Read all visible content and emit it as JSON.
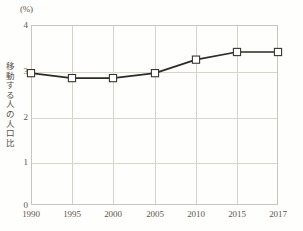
{
  "chart_data": {
    "type": "line",
    "title": "",
    "subtitle": "",
    "unit_label": "(%)",
    "ylabel": "移動する人の人口比",
    "xlabel": "",
    "categories": [
      "1990",
      "1995",
      "2000",
      "2005",
      "2010",
      "2015",
      "2017"
    ],
    "x": [
      1990,
      1995,
      2000,
      2005,
      2010,
      2015,
      2017
    ],
    "values": [
      2.93,
      2.82,
      2.82,
      2.93,
      3.23,
      3.4,
      3.4
    ],
    "series": [
      {
        "name": "移動する人の人口比",
        "values": [
          2.93,
          2.82,
          2.82,
          2.93,
          3.23,
          3.4,
          3.4
        ]
      }
    ],
    "ylim": [
      0,
      4
    ],
    "yticks": [
      "0",
      "1",
      "2",
      "3",
      "4"
    ],
    "ytick_values": [
      0,
      1,
      2,
      3,
      4
    ],
    "xticks": [
      "1990",
      "1995",
      "2000",
      "2005",
      "2010",
      "2015",
      "2017"
    ],
    "grid": true,
    "legend": false,
    "legend_position": "none",
    "marker": "square-open",
    "colors": {
      "line": "#2e2a24",
      "marker_fill": "#ffffff",
      "marker_stroke": "#3a352e",
      "grid": "#d6d3ca",
      "axis": "#c9c6bd",
      "text": "#5d584f",
      "background": "#fefefc"
    }
  }
}
